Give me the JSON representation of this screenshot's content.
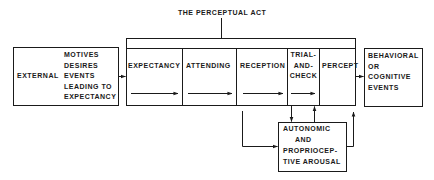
{
  "title": "THE PERCEPTUAL ACT",
  "external_box": {
    "left_label": "EXTERNAL",
    "lines": [
      "MOTIVES",
      "DESIRES",
      "EVENTS",
      "LEADING TO",
      "EXPECTANCY"
    ]
  },
  "stages": [
    {
      "id": "expectancy",
      "lines": [
        "EXPECTANCY"
      ]
    },
    {
      "id": "attending",
      "lines": [
        "ATTENDING"
      ]
    },
    {
      "id": "reception",
      "lines": [
        "RECEPTION"
      ]
    },
    {
      "id": "trial-and-check",
      "lines": [
        "TRIAL-",
        "AND-",
        "CHECK"
      ]
    },
    {
      "id": "percept",
      "lines": [
        "PERCEPT"
      ]
    }
  ],
  "output_box": {
    "lines": [
      "BEHAVIORAL",
      "OR",
      "COGNITIVE",
      "EVENTS"
    ]
  },
  "arousal_box": {
    "lines": [
      "AUTONOMIC",
      "AND",
      "PROPRIOCEP-",
      "TIVE AROUSAL"
    ]
  },
  "colors": {
    "line": "#1a1a1a",
    "background": "#ffffff"
  }
}
